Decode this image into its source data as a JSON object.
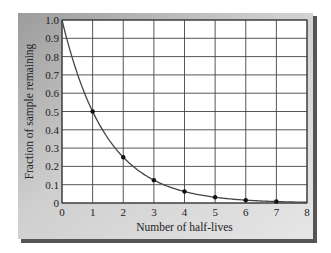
{
  "chart_data": {
    "type": "line",
    "title": "",
    "xlabel": "Number of half-lives",
    "ylabel": "Fraction of sample remaining",
    "x": [
      0,
      1,
      2,
      3,
      4,
      5,
      6,
      7,
      8
    ],
    "series": [
      {
        "name": "Fraction remaining",
        "values": [
          1.0,
          0.5,
          0.25,
          0.125,
          0.0625,
          0.03125,
          0.015625,
          0.0078125,
          0.00390625
        ],
        "markers_at": [
          1,
          2,
          3,
          4,
          5,
          6,
          7
        ],
        "curve": "exponential decay (0.5^n), smooth"
      }
    ],
    "xlim": [
      0,
      8
    ],
    "ylim": [
      0,
      1.0
    ],
    "xticks": [
      "0",
      "1",
      "2",
      "3",
      "4",
      "5",
      "6",
      "7",
      "8"
    ],
    "yticks": [
      "0",
      "0.1",
      "0.2",
      "0.3",
      "0.4",
      "0.5",
      "0.6",
      "0.7",
      "0.8",
      "0.9",
      "1.0"
    ],
    "grid": true,
    "legend": "none"
  },
  "style": {
    "panel_gradient_start": "#9c9c9c",
    "panel_gradient_end": "#e6e6e6",
    "panel_shadow": "#555555",
    "plot_background": "#ffffff",
    "grid_color": "#444444",
    "curve_color": "#444444",
    "marker_color": "#111111"
  }
}
